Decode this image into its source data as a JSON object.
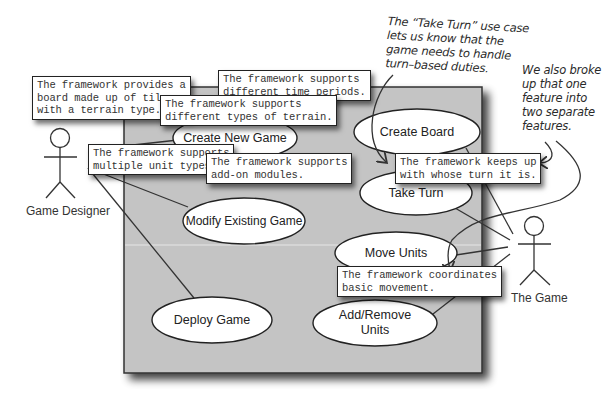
{
  "diagram": {
    "type": "uml-use-case",
    "system_boundary": {
      "x": 124,
      "y": 87,
      "width": 358,
      "height": 286,
      "fill": "#c4c4c4"
    },
    "actors": [
      {
        "id": "game-designer",
        "label": "Game Designer",
        "x": 60,
        "head_y": 137
      },
      {
        "id": "the-game",
        "label": "The Game",
        "x": 534,
        "head_y": 227
      }
    ],
    "use_cases": [
      {
        "id": "create-new-game",
        "label": "Create New Game",
        "cx": 235,
        "cy": 138,
        "rx": 62,
        "ry": 22
      },
      {
        "id": "modify-existing-game",
        "label": "Modify Existing Game",
        "cx": 244,
        "cy": 221,
        "rx": 61,
        "ry": 23
      },
      {
        "id": "deploy-game",
        "label": "Deploy Game",
        "cx": 212,
        "cy": 320,
        "rx": 60,
        "ry": 23
      },
      {
        "id": "create-board",
        "label": "Create Board",
        "cx": 417,
        "cy": 132,
        "rx": 63,
        "ry": 23
      },
      {
        "id": "take-turn",
        "label": "Take Turn",
        "cx": 416,
        "cy": 193,
        "rx": 56,
        "ry": 22
      },
      {
        "id": "move-units",
        "label": "Move Units",
        "cx": 396,
        "cy": 253,
        "rx": 61,
        "ry": 21
      },
      {
        "id": "add-remove-units",
        "label": "Add/Remove\nUnits",
        "cx": 375,
        "cy": 323,
        "rx": 62,
        "ry": 23
      }
    ],
    "notes": [
      {
        "id": "note-board-tiles",
        "text": "The framework provides a\nboard made up of tiles,\nwith a terrain type.",
        "x": 32,
        "y": 76
      },
      {
        "id": "note-time-periods",
        "text": "The framework supports\ndifferent time periods.",
        "x": 218,
        "y": 70
      },
      {
        "id": "note-terrain-types",
        "text": "The framework supports\ndifferent types of terrain.",
        "x": 160,
        "y": 95
      },
      {
        "id": "note-unit-types",
        "text": "The framework supports\nmultiple unit types.",
        "x": 88,
        "y": 144
      },
      {
        "id": "note-addon-modules",
        "text": "The framework supports\nadd-on modules.",
        "x": 206,
        "y": 153
      },
      {
        "id": "note-whose-turn",
        "text": "The framework keeps up\nwith whose turn it is.",
        "x": 395,
        "y": 153
      },
      {
        "id": "note-basic-movement",
        "text": "The framework coordinates\nbasic movement.",
        "x": 337,
        "y": 266
      }
    ],
    "annotations": [
      {
        "id": "annotation-take-turn",
        "text": "The “Take Turn” use case\nlets us know that the\ngame needs to handle\nturn–based duties.",
        "x": 388,
        "y": 14
      },
      {
        "id": "annotation-separate-features",
        "text": "We also broke\nup that one\nfeature into\ntwo separate\nfeatures.",
        "x": 523,
        "y": 62
      }
    ],
    "colors": {
      "boundary_fill": "#c4c4c4",
      "line": "#333333",
      "ellipse_fill": "#ffffff",
      "note_fill": "#ffffff"
    }
  }
}
